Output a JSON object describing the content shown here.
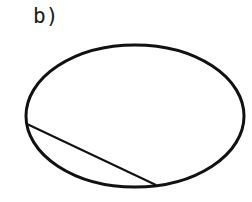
{
  "figure": {
    "label": "b)",
    "ellipse": {
      "cx": 135,
      "cy": 116,
      "rx": 109,
      "ry": 71,
      "stroke": "#111111",
      "stroke_width": 3
    },
    "chord": {
      "x1": 27,
      "y1": 124,
      "x2": 156,
      "y2": 185,
      "stroke": "#111111",
      "stroke_width": 2
    }
  }
}
